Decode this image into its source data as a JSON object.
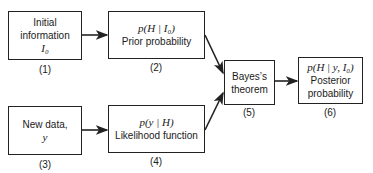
{
  "diagram": {
    "type": "flowchart",
    "nodes": [
      {
        "id": 1,
        "lines": [
          "Initial",
          "information"
        ],
        "math": "I₀",
        "number": "(1)"
      },
      {
        "id": 2,
        "math": "p(H | I₀)",
        "lines": [
          "Prior probability"
        ],
        "number": "(2)"
      },
      {
        "id": 3,
        "lines": [
          "New data,"
        ],
        "math": "y",
        "number": "(3)"
      },
      {
        "id": 4,
        "math": "p(y | H)",
        "lines": [
          "Likelihood function"
        ],
        "number": "(4)"
      },
      {
        "id": 5,
        "lines": [
          "Bayes’s",
          "theorem"
        ],
        "number": "(5)"
      },
      {
        "id": 6,
        "math": "p(H | y, I₀)",
        "lines": [
          "Posterior",
          "probability"
        ],
        "number": "(6)"
      }
    ],
    "edges": [
      {
        "from": 1,
        "to": 2
      },
      {
        "from": 3,
        "to": 4
      },
      {
        "from": 2,
        "to": 5
      },
      {
        "from": 4,
        "to": 5
      },
      {
        "from": 5,
        "to": 6
      }
    ],
    "stroke_color": "#222222"
  }
}
